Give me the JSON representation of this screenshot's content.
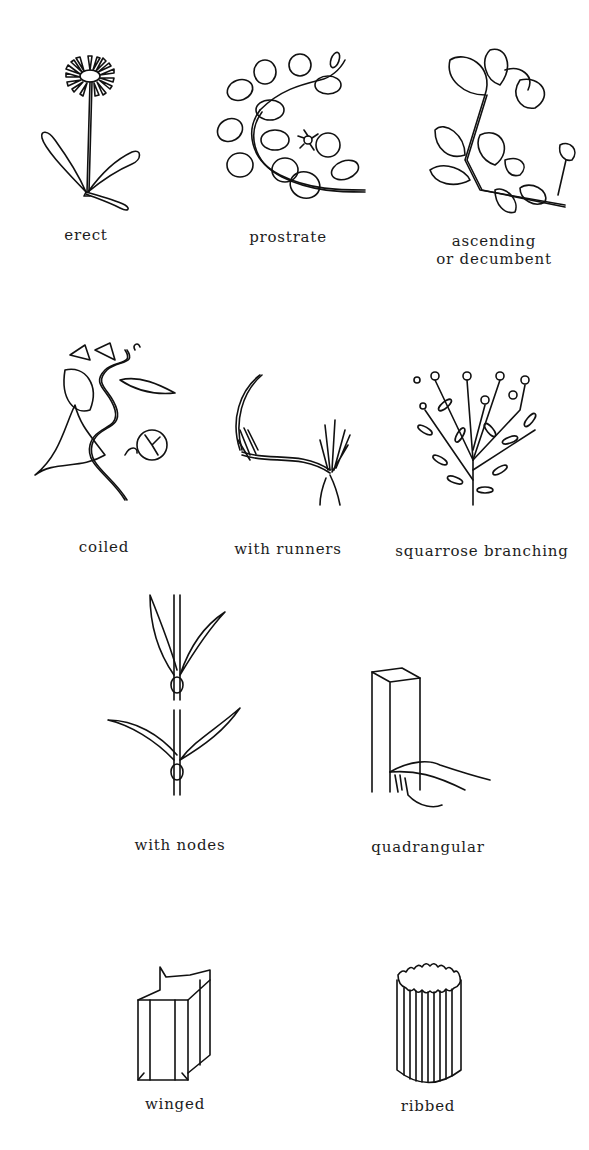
{
  "figures": [
    {
      "id": "erect",
      "label": "erect",
      "row": 1,
      "col": 1
    },
    {
      "id": "prostrate",
      "label": "prostrate",
      "row": 1,
      "col": 2
    },
    {
      "id": "ascending",
      "label": "ascending",
      "label_line2": "or decumbent",
      "row": 1,
      "col": 3
    },
    {
      "id": "coiled",
      "label": "coiled",
      "row": 2,
      "col": 1
    },
    {
      "id": "runners",
      "label": "with runners",
      "row": 2,
      "col": 2
    },
    {
      "id": "squarrose",
      "label": "squarrose branching",
      "row": 2,
      "col": 3
    },
    {
      "id": "nodes",
      "label": "with nodes",
      "row": 3,
      "col": 1
    },
    {
      "id": "quadrangular",
      "label": "quadrangular",
      "row": 3,
      "col": 2
    },
    {
      "id": "winged",
      "label": "winged",
      "row": 4,
      "col": 1
    },
    {
      "id": "ribbed",
      "label": "ribbed",
      "row": 4,
      "col": 2
    }
  ]
}
